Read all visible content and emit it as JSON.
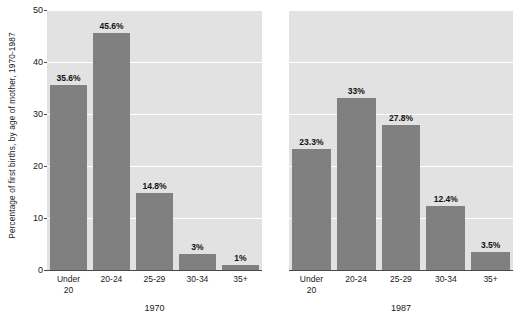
{
  "figure": {
    "ylabel": "Percentage of first births, by age of mother, 1970-1987",
    "background_color": "#ffffff",
    "plot_background_color": "#e2e2e2",
    "bar_color": "#808080",
    "gridline_color": "#ffffff",
    "axis_color": "#4a4a4a"
  },
  "chart_data": [
    {
      "type": "bar",
      "title": "1970",
      "xlabel": "",
      "ylabel": "Percentage of first births, by age of mother, 1970-1987",
      "categories": [
        "Under\n20",
        "20-24",
        "25-29",
        "30-34",
        "35+"
      ],
      "values": [
        35.6,
        45.6,
        14.8,
        3,
        1
      ],
      "value_labels": [
        "35.6%",
        "45.6%",
        "14.8%",
        "3%",
        "1%"
      ],
      "ylim": [
        0,
        50
      ],
      "yticks": [
        0,
        10,
        20,
        30,
        40,
        50
      ],
      "ytick_labels": [
        "0",
        "10",
        "20",
        "30",
        "40",
        "50"
      ],
      "grid": true,
      "legend": "none"
    },
    {
      "type": "bar",
      "title": "1987",
      "xlabel": "",
      "ylabel": "",
      "categories": [
        "Under\n20",
        "20-24",
        "25-29",
        "30-34",
        "35+"
      ],
      "values": [
        23.3,
        33,
        27.8,
        12.4,
        3.5
      ],
      "value_labels": [
        "23.3%",
        "33%",
        "27.8%",
        "12.4%",
        "3.5%"
      ],
      "ylim": [
        0,
        50
      ],
      "yticks": [
        0,
        10,
        20,
        30,
        40,
        50
      ],
      "ytick_labels": [
        "0",
        "10",
        "20",
        "30",
        "40",
        "50"
      ],
      "grid": true,
      "legend": "none"
    }
  ]
}
